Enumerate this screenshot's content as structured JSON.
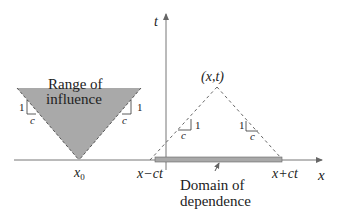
{
  "diagram": {
    "axes": {
      "t_label": "t",
      "x_label": "x"
    },
    "range_of_influence": {
      "label_line1": "Range of",
      "label_line2": "influence",
      "vertex_label": "x",
      "vertex_sub": "0",
      "fill": "#a9a9a9"
    },
    "slope_markers": {
      "rise": "1",
      "run": "c"
    },
    "point": {
      "label": "(x,t)"
    },
    "domain_of_dependence": {
      "left_label": "x−ct",
      "right_label": "x+ct",
      "label_line1": "Domain of",
      "label_line2": "dependence",
      "fill": "#a9a9a9"
    }
  }
}
